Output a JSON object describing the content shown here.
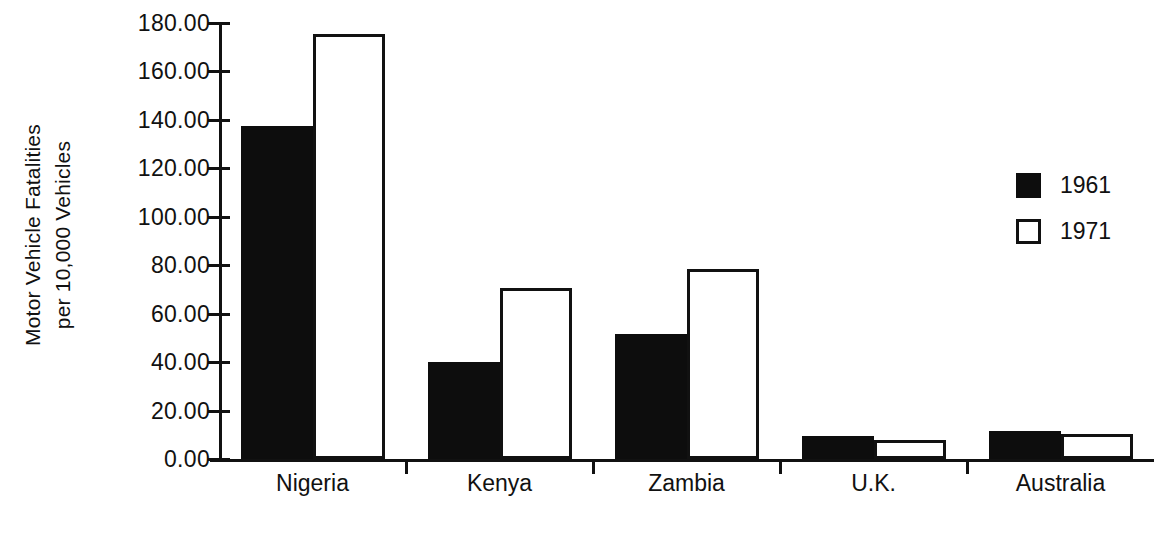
{
  "chart_data": {
    "type": "bar",
    "title": "",
    "subtitle": "",
    "xlabel": "",
    "ylabel": "Motor Vehicle Fatalities per 10,000 Vehicles",
    "ylabel_lines": [
      "Motor Vehicle Fatalities",
      "per 10,000 Vehicles"
    ],
    "categories": [
      "Nigeria",
      "Kenya",
      "Zambia",
      "U.K.",
      "Australia"
    ],
    "series": [
      {
        "name": "1961",
        "values": [
          137.5,
          40.0,
          51.5,
          9.5,
          11.5
        ],
        "style": "filled",
        "color": "#0d0d0d"
      },
      {
        "name": "1971",
        "values": [
          175.5,
          70.5,
          78.5,
          8.0,
          10.5
        ],
        "style": "open",
        "color": "#ffffff"
      }
    ],
    "ylim": [
      0,
      180
    ],
    "ytick_values": [
      0,
      20,
      40,
      60,
      80,
      100,
      120,
      140,
      160,
      180
    ],
    "ytick_labels": [
      "0.00",
      "20.00",
      "40.00",
      "60.00",
      "80.00",
      "100.00",
      "120.00",
      "140.00",
      "160.00",
      "180.00"
    ],
    "grid": false,
    "legend_position": "right",
    "legend": [
      {
        "label": "1961",
        "swatch": "filled-square"
      },
      {
        "label": "1971",
        "swatch": "open-square"
      }
    ]
  },
  "colors": {
    "ink": "#111111",
    "fill_1961": "#0d0d0d",
    "fill_1971": "#ffffff",
    "background": "#ffffff"
  }
}
